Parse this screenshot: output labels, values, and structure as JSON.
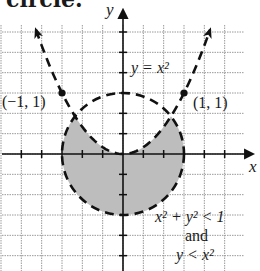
{
  "header_fragment": "circle.",
  "chart_data": {
    "type": "region",
    "title": "",
    "xlabel": "x",
    "ylabel": "y",
    "xlim": [
      -2,
      2
    ],
    "ylim": [
      -2,
      2
    ],
    "grid": true,
    "grid_step": 0.3333,
    "tick_step": 0.3333,
    "curves": [
      {
        "name": "y = x^2",
        "label": "y = x²",
        "kind": "parabola",
        "equation": "y = x^2",
        "style": "dashed",
        "arrows": true
      },
      {
        "name": "x^2 + y^2 = 1",
        "kind": "circle",
        "center": [
          0,
          0
        ],
        "radius": 1,
        "style": "dashed"
      }
    ],
    "points": [
      {
        "x": -1,
        "y": 1,
        "label": "(−1, 1)"
      },
      {
        "x": 1,
        "y": 1,
        "label": "(1, 1)"
      }
    ],
    "shaded_region": {
      "description": "x^2 + y^2 < 1 and y < x^2",
      "fill": "#bdbdbd"
    },
    "annotation": {
      "line1": "x² + y² < 1",
      "line2": "and",
      "line3": "y < x²"
    },
    "colors": {
      "curve": "#111111",
      "grid": "#9a9a9a",
      "axis": "#111111",
      "shade": "#bdbdbd"
    }
  }
}
